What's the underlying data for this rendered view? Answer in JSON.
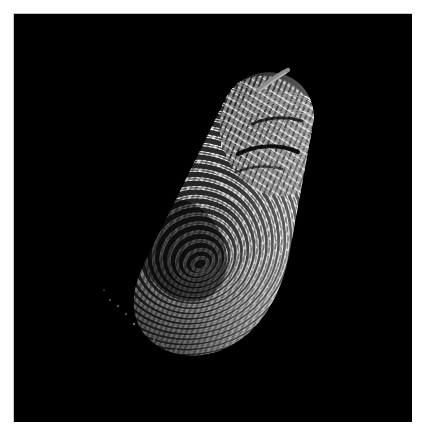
{
  "page": {
    "width": 429,
    "height": 439,
    "background_color": "#ffffff",
    "margin_color": "#ffffff"
  },
  "scan": {
    "title": "Fingerprint Ridge Scan",
    "background_color": "#000000",
    "frame": {
      "x": 14,
      "y": 14,
      "width": 398,
      "height": 408
    },
    "subject": "fingertip",
    "modality": "grayscale optical fingerprint capture",
    "ridge_color_bright": "#f2f2f2",
    "ridge_color_mid": "#9a9a9a",
    "ridge_color_faint": "#4a4a4a",
    "artifact_color": "#8d8d8d",
    "orientation_degrees": -22,
    "notes": "Tilted fingertip impression, ridges form concentric arcs around a core near the lower centre; impression fades toward the lower-left."
  },
  "finger": {
    "tip_point": {
      "x": 272,
      "y": 86
    },
    "core_point": {
      "x": 196,
      "y": 272
    },
    "base_point": {
      "x": 150,
      "y": 330
    },
    "tip_width": 84,
    "base_width": 132,
    "brightest_region": "upper tip",
    "faintest_region": "lower left"
  },
  "artifact": {
    "name": "hair-streak",
    "from": {
      "x": 258,
      "y": 75
    },
    "to": {
      "x": 283,
      "y": 66
    },
    "thickness": 4
  },
  "ridges": {
    "count_primary": 34,
    "spacing_px": 7,
    "pattern": "concentric-arc-loop"
  }
}
